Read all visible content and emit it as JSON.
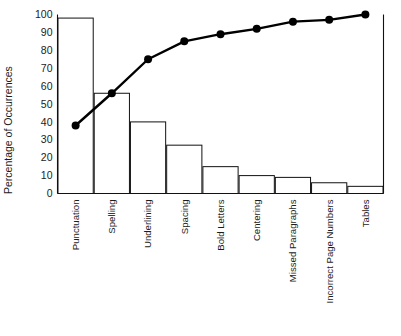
{
  "chart_data": {
    "type": "bar",
    "title": "",
    "subtitle": "",
    "xlabel": "",
    "ylabel": "Percentage of Occurrences",
    "ylim": [
      0,
      100
    ],
    "yticks": [
      0,
      10,
      20,
      30,
      40,
      50,
      60,
      70,
      80,
      90,
      100
    ],
    "ytick_labels": [
      "0",
      "10",
      "20",
      "30",
      "40",
      "50",
      "60",
      "70",
      "80",
      "90",
      "100"
    ],
    "grid": false,
    "legend": "none",
    "categories": [
      "Punctuation",
      "Spelling",
      "Underlining",
      "Spacing",
      "Bold Letters",
      "Centering",
      "Missed Paragraphs",
      "Incorrect Page Numbers",
      "Tables"
    ],
    "values": [
      98,
      56,
      40,
      27,
      15,
      10,
      9,
      6,
      4
    ],
    "series": [
      {
        "name": "Percentage of Occurrences",
        "type": "bar",
        "values": [
          98,
          56,
          40,
          27,
          15,
          10,
          9,
          6,
          4
        ]
      },
      {
        "name": "Cumulative Percentage",
        "type": "line",
        "values": [
          38,
          56,
          75,
          85,
          89,
          92,
          96,
          97,
          100
        ]
      }
    ],
    "colors": {
      "bar_fill": "#ffffff",
      "bar_stroke": "#111111",
      "line": "#000000",
      "marker": "#000000",
      "axis": "#111111",
      "text": "#1c1c1c",
      "background": "#ffffff"
    },
    "label_rotation_degrees": -90
  }
}
